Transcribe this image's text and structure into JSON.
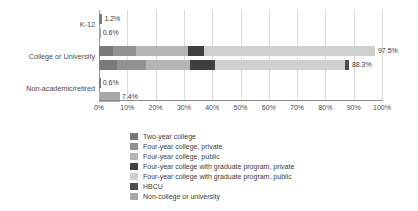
{
  "chart_data": {
    "type": "bar",
    "orientation": "horizontal",
    "stacked": true,
    "title": "",
    "xlabel": "",
    "ylabel": "",
    "xlim": [
      0,
      100
    ],
    "xticks": [
      "0%",
      "10%",
      "20%",
      "30%",
      "40%",
      "50%",
      "60%",
      "70%",
      "80%",
      "90%",
      "100%"
    ],
    "xtick_values": [
      0,
      10,
      20,
      30,
      40,
      50,
      60,
      70,
      80,
      90,
      100
    ],
    "grid": true,
    "legend_position": "bottom",
    "categories": [
      "K-12",
      "College or University",
      "Non-academic/retired"
    ],
    "series": [
      {
        "name": "Two-year college",
        "color": "#7a7a7a"
      },
      {
        "name": "Four-year college, private",
        "color": "#929292"
      },
      {
        "name": "Four-year college, public",
        "color": "#b5b5b5"
      },
      {
        "name": "Four-year college with graduate program, private",
        "color": "#3f3f3f"
      },
      {
        "name": "Four-year college with graduate program, public",
        "color": "#cfcfcf"
      },
      {
        "name": "HBCU",
        "color": "#4d4d4d"
      },
      {
        "name": "Non-college or university",
        "color": "#a8a8a8"
      }
    ],
    "bars": [
      {
        "category": "K-12",
        "rows": [
          {
            "label": "1.2%",
            "total": 1.2,
            "segments": [
              {
                "series": "Two-year college",
                "value": 1.2,
                "color": "#7a7a7a"
              }
            ]
          },
          {
            "label": "0.6%",
            "total": 0.6,
            "segments": [
              {
                "series": "Non-college or university",
                "value": 0.6,
                "color": "#a8a8a8"
              }
            ]
          }
        ]
      },
      {
        "category": "College or University",
        "rows": [
          {
            "label": "97.5%",
            "total": 97.5,
            "segments": [
              {
                "series": "Two-year college",
                "value": 5.0,
                "color": "#7a7a7a"
              },
              {
                "series": "Four-year college, private",
                "value": 8.0,
                "color": "#929292"
              },
              {
                "series": "Four-year college, public",
                "value": 18.5,
                "color": "#b5b5b5"
              },
              {
                "series": "Four-year college with graduate program, private",
                "value": 5.5,
                "color": "#3f3f3f"
              },
              {
                "series": "Four-year college with graduate program, public",
                "value": 60.5,
                "color": "#cfcfcf"
              }
            ]
          },
          {
            "label": "88.3%",
            "total": 88.3,
            "segments": [
              {
                "series": "Two-year college",
                "value": 6.5,
                "color": "#7a7a7a"
              },
              {
                "series": "Four-year college, private",
                "value": 10.0,
                "color": "#929292"
              },
              {
                "series": "Four-year college, public",
                "value": 15.5,
                "color": "#b5b5b5"
              },
              {
                "series": "Four-year college with graduate program, private",
                "value": 9.0,
                "color": "#3f3f3f"
              },
              {
                "series": "Four-year college with graduate program, public",
                "value": 45.8,
                "color": "#cfcfcf"
              },
              {
                "series": "HBCU",
                "value": 1.5,
                "color": "#4d4d4d"
              }
            ]
          }
        ]
      },
      {
        "category": "Non-academic/retired",
        "rows": [
          {
            "label": "0.6%",
            "total": 0.6,
            "segments": [
              {
                "series": "Two-year college",
                "value": 0.6,
                "color": "#7a7a7a"
              }
            ]
          },
          {
            "label": "7.4%",
            "total": 7.4,
            "segments": [
              {
                "series": "Non-college or university",
                "value": 7.4,
                "color": "#a8a8a8"
              }
            ]
          }
        ]
      }
    ]
  },
  "legend": {
    "items": [
      {
        "label": "Two-year college",
        "color": "#7a7a7a"
      },
      {
        "label": "Four-year college, private",
        "color": "#929292"
      },
      {
        "label": "Four-year college, public",
        "color": "#b5b5b5"
      },
      {
        "label": "Four-year college with graduate program, private",
        "color": "#3f3f3f"
      },
      {
        "label": "Four-year college with graduate program, public",
        "color": "#cfcfcf"
      },
      {
        "label": "HBCU",
        "color": "#4d4d4d"
      },
      {
        "label": "Non-college or university",
        "color": "#a8a8a8"
      }
    ]
  }
}
